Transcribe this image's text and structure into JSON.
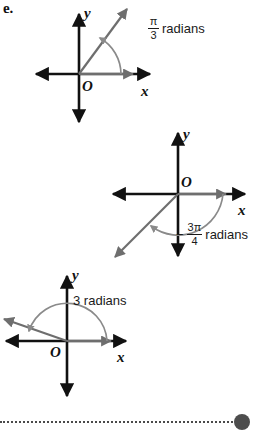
{
  "part": {
    "letter": "e."
  },
  "colors": {
    "axis": "#111111",
    "ray": "#6e6e6e",
    "arc": "#8a8a8a",
    "text": "#1a1a1a",
    "leader": "#4a4a4a",
    "dot": "#4d4d4d",
    "background": "#ffffff"
  },
  "diagrams": [
    {
      "id": "angle-pi-over-3",
      "origin_label": "O",
      "x_axis_label": "x",
      "y_axis_label": "y",
      "measure": {
        "sign": "",
        "numerator": "π",
        "denominator": "3",
        "unit": "radians",
        "full_text": "π/3 radians"
      },
      "angle_degrees": 60,
      "direction": "counterclockwise",
      "terminal_quadrant": "I"
    },
    {
      "id": "angle-negative-3pi-over-4",
      "origin_label": "O",
      "x_axis_label": "x",
      "y_axis_label": "y",
      "measure": {
        "sign": "−",
        "numerator": "3π",
        "denominator": "4",
        "unit": "radians",
        "full_text": "−3π/4 radians"
      },
      "angle_degrees": -135,
      "direction": "clockwise",
      "terminal_quadrant": "III"
    },
    {
      "id": "angle-3-radians",
      "origin_label": "O",
      "x_axis_label": "x",
      "y_axis_label": "y",
      "measure": {
        "sign": "",
        "numerator": "",
        "denominator": "",
        "unit": "3 radians",
        "full_text": "3 radians"
      },
      "angle_degrees": 172,
      "direction": "counterclockwise",
      "terminal_quadrant": "II"
    }
  ]
}
